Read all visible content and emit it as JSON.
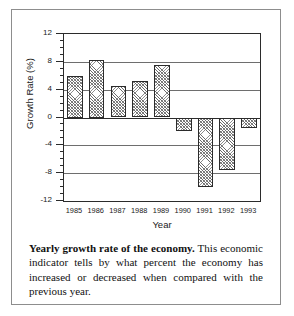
{
  "chart_data": {
    "type": "bar",
    "title": "",
    "xlabel": "Year",
    "ylabel": "Growth Rate (%)",
    "categories": [
      "1985",
      "1986",
      "1987",
      "1988",
      "1989",
      "1990",
      "1991",
      "1992",
      "1993"
    ],
    "values": [
      6.0,
      8.3,
      4.5,
      5.3,
      7.6,
      -2.0,
      -10.0,
      -7.5,
      -1.5
    ],
    "ylim": [
      -12,
      12
    ],
    "ytick_labels": [
      "12",
      "8",
      "4",
      "0",
      "-4",
      "-8",
      "-12"
    ],
    "ytick_values": [
      12,
      8,
      4,
      0,
      -4,
      -8,
      -12
    ],
    "yminor_step": 1,
    "grid": "horizontal",
    "legend": "none",
    "series": [
      {
        "name": "Growth Rate",
        "values": [
          6.0,
          8.3,
          4.5,
          5.3,
          7.6,
          -2.0,
          -10.0,
          -7.5,
          -1.5
        ]
      }
    ]
  },
  "caption": {
    "lead": "Yearly growth rate of the economy.",
    "body": " This economic indicator tells by what percent the economy has increased or decreased when compared with the previous year."
  }
}
